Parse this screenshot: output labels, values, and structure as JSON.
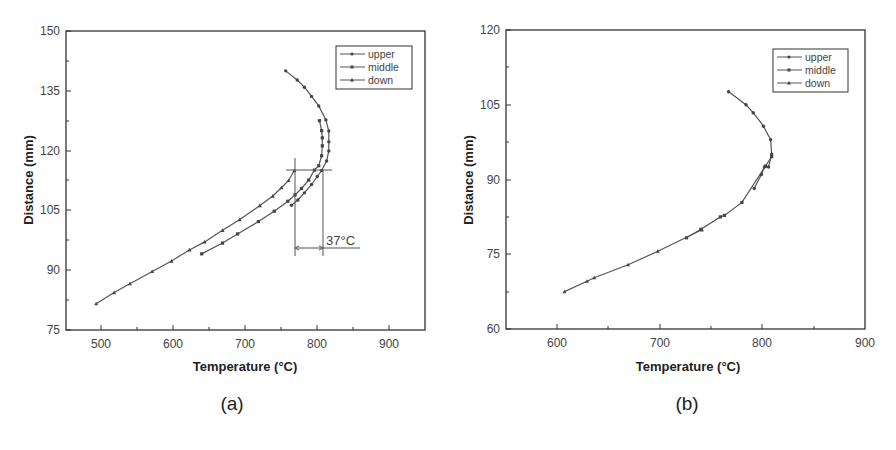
{
  "chart_data": [
    {
      "panel": "(a)",
      "type": "line",
      "title": "",
      "xlabel": "Temperature (°C)",
      "ylabel": "Distance (mm)",
      "xlim": [
        450,
        950
      ],
      "ylim": [
        75,
        150
      ],
      "xticks": [
        500,
        600,
        700,
        800,
        900
      ],
      "yticks": [
        75,
        90,
        105,
        120,
        135,
        150
      ],
      "grid": false,
      "legend_position": "upper right",
      "legend": [
        "upper",
        "middle",
        "down"
      ],
      "series": [
        {
          "name": "upper",
          "marker": "circle",
          "points": [
            [
              756,
              140.0
            ],
            [
              772,
              137.7
            ],
            [
              782,
              135.9
            ],
            [
              792,
              133.6
            ],
            [
              802,
              131.2
            ],
            [
              812,
              127.7
            ],
            [
              816,
              124.9
            ],
            [
              816,
              122.2
            ],
            [
              816,
              119.9
            ],
            [
              813,
              117.4
            ],
            [
              806,
              115.0
            ],
            [
              800,
              113.5
            ],
            [
              792,
              111.5
            ],
            [
              782,
              109.4
            ],
            [
              773,
              107.6
            ],
            [
              764,
              106.3
            ]
          ]
        },
        {
          "name": "middle",
          "marker": "square",
          "points": [
            [
              803,
              127.5
            ],
            [
              806,
              125.0
            ],
            [
              807,
              123.2
            ],
            [
              807,
              121.2
            ],
            [
              806,
              118.7
            ],
            [
              802,
              116.2
            ],
            [
              796,
              115.1
            ],
            [
              788,
              112.6
            ],
            [
              778,
              110.5
            ],
            [
              769,
              108.9
            ],
            [
              759,
              107.3
            ],
            [
              740,
              104.8
            ],
            [
              718,
              102.2
            ],
            [
              689,
              99.1
            ],
            [
              668,
              96.8
            ],
            [
              639,
              94.1
            ]
          ]
        },
        {
          "name": "down",
          "marker": "triangle",
          "points": [
            [
              492,
              81.6
            ],
            [
              517,
              84.4
            ],
            [
              539,
              86.6
            ],
            [
              570,
              89.7
            ],
            [
              597,
              92.3
            ],
            [
              622,
              95.1
            ],
            [
              643,
              97.1
            ],
            [
              668,
              100.0
            ],
            [
              692,
              102.7
            ],
            [
              720,
              106.2
            ],
            [
              738,
              108.6
            ],
            [
              750,
              110.7
            ],
            [
              760,
              112.5
            ],
            [
              768,
              115.0
            ]
          ]
        }
      ],
      "annotations": [
        {
          "text": "37°C",
          "type": "temperature-difference",
          "from_x": 770,
          "to_x": 809,
          "at_y": 115
        }
      ]
    },
    {
      "panel": "(b)",
      "type": "line",
      "title": "",
      "xlabel": "Temperature (°C)",
      "ylabel": "Distance (mm)",
      "xlim": [
        550,
        900
      ],
      "ylim": [
        60,
        120
      ],
      "xticks": [
        600,
        700,
        800,
        900
      ],
      "yticks": [
        60,
        75,
        90,
        105,
        120
      ],
      "grid": false,
      "legend_position": "upper right",
      "legend": [
        "upper",
        "middle",
        "down"
      ],
      "series": [
        {
          "name": "upper",
          "marker": "circle",
          "points": [
            [
              767,
              107.6
            ],
            [
              784,
              105.0
            ],
            [
              791,
              103.4
            ],
            [
              801,
              100.7
            ],
            [
              808,
              98.0
            ],
            [
              809,
              95.1
            ],
            [
              806,
              92.5
            ],
            [
              802,
              92.5
            ],
            [
              799,
              91.0
            ],
            [
              792,
              88.2
            ]
          ]
        },
        {
          "name": "middle",
          "marker": "square",
          "points": [
            [
              809,
              94.6
            ],
            [
              803,
              92.7
            ],
            [
              780,
              85.4
            ],
            [
              763,
              82.8
            ],
            [
              759,
              82.5
            ],
            [
              740,
              80.0
            ],
            [
              726,
              78.3
            ]
          ]
        },
        {
          "name": "down",
          "marker": "triangle",
          "points": [
            [
              741,
              79.9
            ],
            [
              698,
              75.6
            ],
            [
              669,
              72.9
            ],
            [
              636,
              70.3
            ],
            [
              629,
              69.6
            ],
            [
              607,
              67.5
            ]
          ]
        }
      ],
      "annotations": []
    }
  ],
  "panels": {
    "a": {
      "label": "(a)",
      "xlabel": "Temperature (°C)",
      "ylabel": "Distance (mm)",
      "annotation": "37°C",
      "legend": {
        "upper": "upper",
        "middle": "middle",
        "down": "down"
      },
      "xticks": [
        "500",
        "600",
        "700",
        "800",
        "900"
      ],
      "yticks": [
        "75",
        "90",
        "105",
        "120",
        "135",
        "150"
      ]
    },
    "b": {
      "label": "(b)",
      "xlabel": "Temperature (°C)",
      "ylabel": "Distance (mm)",
      "legend": {
        "upper": "upper",
        "middle": "middle",
        "down": "down"
      },
      "xticks": [
        "600",
        "700",
        "800",
        "900"
      ],
      "yticks": [
        "60",
        "75",
        "90",
        "105",
        "120"
      ]
    }
  },
  "colors": {
    "line": "#555555",
    "marker": "#444444",
    "axis": "#333333",
    "background": "#ffffff"
  }
}
